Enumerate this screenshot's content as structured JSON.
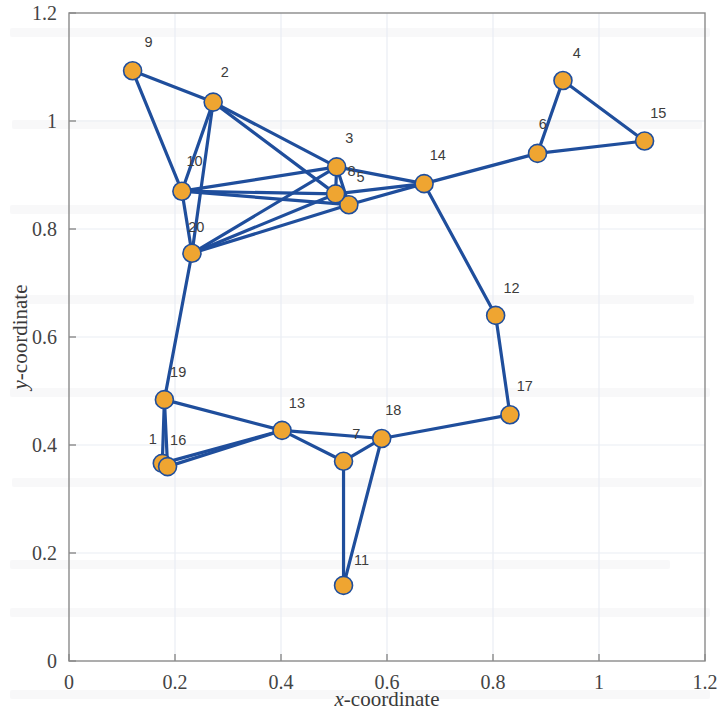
{
  "figure": {
    "type": "graph-node-plot",
    "background_color": "#ffffff"
  },
  "axes": {
    "x": {
      "label_prefix": "x",
      "label_suffix": "-coordinate",
      "label_full": "x-coordinate",
      "min": 0,
      "max": 1.2,
      "tick_values": [
        0,
        0.2,
        0.4,
        0.6,
        0.8,
        1,
        1.2
      ],
      "tick_labels": [
        "0",
        "0.2",
        "0.4",
        "0.6",
        "0.8",
        "1",
        "1.2"
      ]
    },
    "y": {
      "label_prefix": "y",
      "label_suffix": "-coordinate",
      "label_full": "y-coordinate",
      "min": 0,
      "max": 1.2,
      "tick_values": [
        0,
        0.2,
        0.4,
        0.6,
        0.8,
        1,
        1.2
      ],
      "tick_labels": [
        "0",
        "0.2",
        "0.4",
        "0.6",
        "0.8",
        "1",
        "1.2"
      ]
    },
    "grid": true,
    "grid_color": "#e9edf3",
    "frame_color": "#8a8a8a"
  },
  "style": {
    "node_fill": "#efa531",
    "node_stroke": "#1f4e9c",
    "node_radius_px": 9,
    "edge_color": "#1f4e9c",
    "edge_width_px": 3.2,
    "label_color": "#3c3c3c"
  },
  "chart_data": {
    "type": "scatter",
    "title": "",
    "xlabel": "x-coordinate",
    "ylabel": "y-coordinate",
    "xlim": [
      0,
      1.2
    ],
    "ylim": [
      0,
      1.2
    ],
    "xticks": [
      0,
      0.2,
      0.4,
      0.6,
      0.8,
      1,
      1.2
    ],
    "yticks": [
      0,
      0.2,
      0.4,
      0.6,
      0.8,
      1,
      1.2
    ],
    "grid": true,
    "legend": null,
    "nodes": [
      {
        "id": "1",
        "label": "1",
        "x": 0.176,
        "y": 0.366,
        "label_dx": -0.018,
        "label_dy": 0.036
      },
      {
        "id": "2",
        "label": "2",
        "x": 0.272,
        "y": 1.035,
        "label_dx": 0.022,
        "label_dy": 0.046
      },
      {
        "id": "3",
        "label": "3",
        "x": 0.505,
        "y": 0.915,
        "label_dx": 0.024,
        "label_dy": 0.044
      },
      {
        "id": "4",
        "label": "4",
        "x": 0.932,
        "y": 1.075,
        "label_dx": 0.026,
        "label_dy": 0.042
      },
      {
        "id": "5",
        "label": "5",
        "x": 0.528,
        "y": 0.845,
        "label_dx": 0.022,
        "label_dy": 0.042
      },
      {
        "id": "6",
        "label": "6",
        "x": 0.884,
        "y": 0.94,
        "label_dx": 0.01,
        "label_dy": 0.046
      },
      {
        "id": "7",
        "label": "7",
        "x": 0.518,
        "y": 0.37,
        "label_dx": 0.024,
        "label_dy": 0.042
      },
      {
        "id": "8",
        "label": "8",
        "x": 0.503,
        "y": 0.865,
        "label_dx": 0.03,
        "label_dy": 0.034
      },
      {
        "id": "9",
        "label": "9",
        "x": 0.12,
        "y": 1.093,
        "label_dx": 0.03,
        "label_dy": 0.044
      },
      {
        "id": "10",
        "label": "10",
        "x": 0.213,
        "y": 0.87,
        "label_dx": 0.024,
        "label_dy": 0.046
      },
      {
        "id": "11",
        "label": "11",
        "x": 0.518,
        "y": 0.14,
        "label_dx": 0.034,
        "label_dy": 0.038
      },
      {
        "id": "12",
        "label": "12",
        "x": 0.805,
        "y": 0.64,
        "label_dx": 0.03,
        "label_dy": 0.042
      },
      {
        "id": "13",
        "label": "13",
        "x": 0.402,
        "y": 0.427,
        "label_dx": 0.028,
        "label_dy": 0.042
      },
      {
        "id": "14",
        "label": "14",
        "x": 0.67,
        "y": 0.884,
        "label_dx": 0.026,
        "label_dy": 0.044
      },
      {
        "id": "15",
        "label": "15",
        "x": 1.086,
        "y": 0.963,
        "label_dx": 0.026,
        "label_dy": 0.042
      },
      {
        "id": "16",
        "label": "16",
        "x": 0.186,
        "y": 0.36,
        "label_dx": 0.02,
        "label_dy": 0.04
      },
      {
        "id": "17",
        "label": "17",
        "x": 0.832,
        "y": 0.456,
        "label_dx": 0.028,
        "label_dy": 0.044
      },
      {
        "id": "18",
        "label": "18",
        "x": 0.59,
        "y": 0.412,
        "label_dx": 0.022,
        "label_dy": 0.044
      },
      {
        "id": "19",
        "label": "19",
        "x": 0.18,
        "y": 0.484,
        "label_dx": 0.026,
        "label_dy": 0.042
      },
      {
        "id": "20",
        "label": "20",
        "x": 0.232,
        "y": 0.755,
        "label_dx": 0.008,
        "label_dy": 0.04
      }
    ],
    "edges": [
      [
        "9",
        "2"
      ],
      [
        "9",
        "10"
      ],
      [
        "2",
        "10"
      ],
      [
        "2",
        "20"
      ],
      [
        "2",
        "3"
      ],
      [
        "2",
        "8"
      ],
      [
        "10",
        "20"
      ],
      [
        "10",
        "3"
      ],
      [
        "10",
        "8"
      ],
      [
        "10",
        "5"
      ],
      [
        "20",
        "3"
      ],
      [
        "20",
        "8"
      ],
      [
        "20",
        "5"
      ],
      [
        "20",
        "19"
      ],
      [
        "3",
        "8"
      ],
      [
        "3",
        "5"
      ],
      [
        "3",
        "14"
      ],
      [
        "8",
        "5"
      ],
      [
        "8",
        "14"
      ],
      [
        "5",
        "14"
      ],
      [
        "14",
        "6"
      ],
      [
        "14",
        "12"
      ],
      [
        "6",
        "4"
      ],
      [
        "6",
        "15"
      ],
      [
        "4",
        "15"
      ],
      [
        "12",
        "17"
      ],
      [
        "17",
        "18"
      ],
      [
        "19",
        "1"
      ],
      [
        "19",
        "16"
      ],
      [
        "19",
        "13"
      ],
      [
        "1",
        "13"
      ],
      [
        "16",
        "13"
      ],
      [
        "13",
        "7"
      ],
      [
        "13",
        "18"
      ],
      [
        "7",
        "18"
      ],
      [
        "7",
        "11"
      ],
      [
        "11",
        "18"
      ]
    ]
  }
}
